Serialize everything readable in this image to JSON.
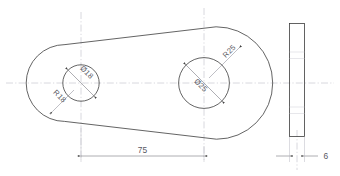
{
  "drawing": {
    "title": "Link plate technical drawing",
    "views": {
      "front": {
        "name": "front-view",
        "small_lobe": {
          "radius_label": "R18",
          "bore_label": "Ø18"
        },
        "large_lobe": {
          "radius_label": "R25",
          "bore_label": "Ø25"
        }
      },
      "side": {
        "name": "side-view",
        "thickness_label": "6"
      }
    },
    "dimensions": {
      "center_distance": "75",
      "small_bore_diameter": "Ø18",
      "small_outer_radius": "R18",
      "large_bore_diameter": "Ø25",
      "large_outer_radius": "R25",
      "thickness": "6"
    },
    "colors": {
      "outline": "#3c3c3c",
      "centerline": "#b9b9c2",
      "dimension": "#6a6a74",
      "text": "#5a5a64",
      "background": "#ffffff"
    }
  }
}
